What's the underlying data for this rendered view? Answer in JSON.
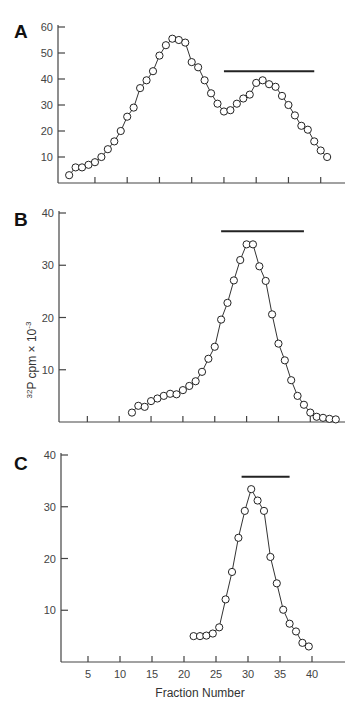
{
  "figure": {
    "xlabel": "Fraction Number",
    "ylabel_main": "P cpm × 10",
    "ylabel_isotope_super": "32",
    "ylabel_exp_super": "-3"
  },
  "chart_data": [
    {
      "type": "line",
      "panel": "A",
      "title": "A",
      "xlabel": "",
      "ylabel": "",
      "xlim": [
        0,
        45
      ],
      "ylim": [
        0,
        60
      ],
      "yticks": [
        10,
        20,
        30,
        40,
        50,
        60
      ],
      "xticks": [
        5,
        10,
        15,
        20,
        25,
        30,
        35,
        40
      ],
      "xtick_labels_shown": false,
      "grid": false,
      "marker": "open-circle",
      "bar": {
        "x_start": 25,
        "x_end": 39,
        "y": 43
      },
      "x": [
        1,
        2,
        3,
        4,
        5,
        6,
        7,
        8,
        9,
        10,
        11,
        12,
        13,
        14,
        15,
        16,
        17,
        18,
        19,
        20,
        21,
        22,
        23,
        24,
        25,
        26,
        27,
        28,
        29,
        30,
        31,
        32,
        33,
        34,
        35,
        36,
        37,
        38,
        39,
        40,
        41
      ],
      "values": [
        3,
        6,
        6,
        7,
        8,
        10,
        13,
        16,
        20,
        25.5,
        29,
        36.5,
        39.5,
        43,
        49,
        53,
        55.5,
        55,
        54,
        46.5,
        44.5,
        39.5,
        34.5,
        30.5,
        27.5,
        28,
        30.5,
        32.5,
        34,
        38.5,
        39.5,
        38,
        37,
        33.5,
        30,
        26,
        22,
        20.5,
        16,
        12.5,
        10,
        7.5
      ]
    },
    {
      "type": "line",
      "panel": "B",
      "title": "B",
      "xlabel": "",
      "ylabel": "32P cpm × 10-3",
      "xlim": [
        0,
        45
      ],
      "ylim": [
        0,
        40
      ],
      "yticks": [
        10,
        20,
        30,
        40
      ],
      "xticks": [
        5,
        10,
        15,
        20,
        25,
        30,
        35,
        40
      ],
      "xtick_labels_shown": false,
      "grid": false,
      "marker": "open-circle",
      "bar": {
        "x_start": 26,
        "x_end": 39,
        "y": 36.5
      },
      "x": [
        12,
        13,
        14,
        15,
        16,
        17,
        18,
        19,
        20,
        21,
        22,
        23,
        24,
        25,
        26,
        27,
        28,
        29,
        30,
        31,
        32,
        33,
        34,
        35,
        36,
        37,
        38,
        39,
        40,
        41,
        42,
        43,
        44
      ],
      "values": [
        1.8,
        3.1,
        2.9,
        4,
        4.5,
        5,
        5.4,
        5.3,
        6.1,
        6.9,
        7.8,
        9.6,
        12.1,
        14.4,
        19.6,
        22.8,
        27.1,
        31,
        34,
        34,
        29.8,
        27,
        20.6,
        15,
        11.8,
        8,
        5,
        3.3,
        1.8,
        1,
        0.8,
        0.6,
        0.5
      ]
    },
    {
      "type": "line",
      "panel": "C",
      "title": "C",
      "xlabel": "Fraction Number",
      "ylabel": "",
      "xlim": [
        0,
        45
      ],
      "ylim": [
        0,
        40
      ],
      "yticks": [
        10,
        20,
        30,
        40
      ],
      "xticks": [
        5,
        10,
        15,
        20,
        25,
        30,
        35,
        40
      ],
      "xtick_labels_shown": true,
      "grid": false,
      "marker": "open-circle",
      "bar": {
        "x_start": 29,
        "x_end": 36.5,
        "y": 35.8
      },
      "x": [
        21.5,
        22.5,
        23.5,
        24.5,
        25.5,
        26.5,
        27.5,
        28.5,
        29.5,
        30.5,
        31.5,
        32.5,
        33.5,
        34.5,
        35.5,
        36.5,
        37.5,
        38.5,
        39.5
      ],
      "values": [
        5,
        5,
        5.1,
        5.5,
        6.7,
        12.1,
        17.4,
        24,
        29.2,
        33.4,
        31.2,
        29.2,
        20.3,
        15.2,
        10.1,
        7.4,
        5.9,
        3.7,
        3
      ]
    }
  ]
}
